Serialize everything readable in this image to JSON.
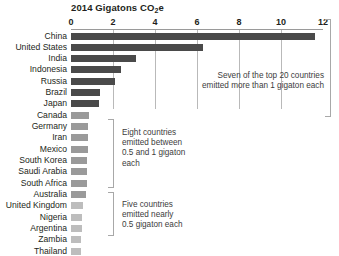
{
  "chart_data": {
    "type": "bar",
    "orientation": "horizontal",
    "title": "2014 Gigatons CO2e",
    "title_main": "2014 Gigatons CO",
    "title_sub": "2",
    "title_tail": "e",
    "xlabel": "",
    "ylabel": "",
    "xlim": [
      0,
      12
    ],
    "ticks": [
      0,
      2,
      4,
      6,
      8,
      10,
      12
    ],
    "tick_labels": [
      "0",
      "2",
      "4",
      "6",
      "8",
      "10",
      "12"
    ],
    "grid": true,
    "legend": "none",
    "categories": [
      "China",
      "United States",
      "India",
      "Indonesia",
      "Russia",
      "Brazil",
      "Japan",
      "Canada",
      "Germany",
      "Iran",
      "Mexico",
      "South Korea",
      "Saudi Arabia",
      "South Africa",
      "Australia",
      "United Kingdom",
      "Nigeria",
      "Argentina",
      "Zambia",
      "Thailand"
    ],
    "values": [
      11.6,
      6.3,
      3.1,
      2.4,
      2.1,
      1.4,
      1.35,
      0.85,
      0.83,
      0.82,
      0.8,
      0.78,
      0.77,
      0.75,
      0.73,
      0.55,
      0.52,
      0.5,
      0.48,
      0.47
    ],
    "group_colors": {
      "tier1": "#4a4a4a",
      "tier2": "#9a9a9a",
      "tier3": "#bdbdbd"
    },
    "bar_groups": [
      "tier1",
      "tier1",
      "tier1",
      "tier1",
      "tier1",
      "tier1",
      "tier1",
      "tier2",
      "tier2",
      "tier2",
      "tier2",
      "tier2",
      "tier2",
      "tier2",
      "tier2",
      "tier3",
      "tier3",
      "tier3",
      "tier3",
      "tier3"
    ],
    "annotations": [
      {
        "id": "tier1-note",
        "text": "Seven of the top 20 countries\nemitted more than 1 gigaton each",
        "covers": [
          "China",
          "Thailand"
        ]
      },
      {
        "id": "tier2-note",
        "text": "Eight countries\nemitted between\n0.5 and 1 gigaton\neach",
        "covers": [
          "Canada",
          "Australia"
        ]
      },
      {
        "id": "tier3-note",
        "text": "Five countries\nemitted nearly\n0.5 gigaton each",
        "covers": [
          "United Kingdom",
          "Thailand"
        ]
      }
    ]
  },
  "colors": {
    "text": "#231f20",
    "note_text": "#3c3c3c",
    "gridline": "#b9b9b9",
    "bracket": "#a8a8a8",
    "background": "#ffffff"
  }
}
